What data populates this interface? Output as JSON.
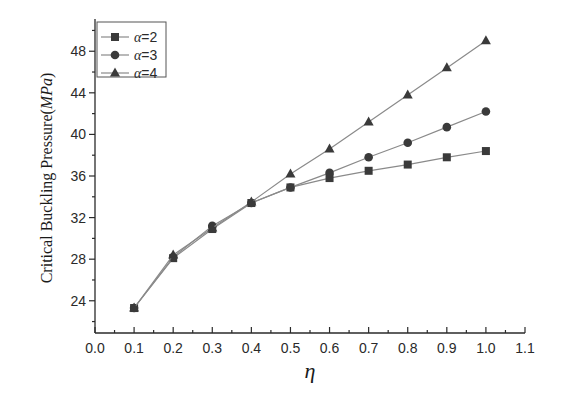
{
  "chart_data": {
    "type": "line",
    "title": "",
    "xlabel": "η",
    "ylabel": "Critical Buckling Pressure(MPa)",
    "ylabel_parts": {
      "main": "Critical Buckling Pressure(",
      "unit": "MPa",
      "close": ")"
    },
    "xlim": [
      0.0,
      1.1
    ],
    "ylim": [
      20.9,
      51.1
    ],
    "x_ticks": [
      0.0,
      0.1,
      0.2,
      0.3,
      0.4,
      0.5,
      0.6,
      0.7,
      0.8,
      0.9,
      1.0,
      1.1
    ],
    "x_tick_labels": [
      "0.0",
      "0.1",
      "0.2",
      "0.3",
      "0.4",
      "0.5",
      "0.6",
      "0.7",
      "0.8",
      "0.9",
      "1.0",
      "1.1"
    ],
    "y_ticks": [
      24,
      28,
      32,
      36,
      40,
      44,
      48
    ],
    "y_tick_labels": [
      "24",
      "28",
      "32",
      "36",
      "40",
      "44",
      "48"
    ],
    "y_minor_step": 2,
    "x_minor_step": 0.05,
    "grid": false,
    "legend_position": "upper left",
    "x": [
      0.1,
      0.2,
      0.3,
      0.4,
      0.5,
      0.6,
      0.7,
      0.8,
      0.9,
      1.0
    ],
    "series": [
      {
        "name": "α=2",
        "greek": "α",
        "suffix": "=2",
        "marker": "square",
        "values": [
          23.3,
          28.1,
          30.9,
          33.4,
          34.9,
          35.8,
          36.5,
          37.1,
          37.8,
          38.4
        ]
      },
      {
        "name": "α=3",
        "greek": "α",
        "suffix": "=3",
        "marker": "circle",
        "values": [
          23.3,
          28.2,
          31.2,
          33.4,
          34.9,
          36.3,
          37.8,
          39.2,
          40.7,
          42.2
        ]
      },
      {
        "name": "α=4",
        "greek": "α",
        "suffix": "=4",
        "marker": "triangle",
        "values": [
          23.3,
          28.4,
          31.0,
          33.5,
          36.2,
          38.6,
          41.2,
          43.8,
          46.4,
          49.0
        ]
      }
    ]
  },
  "style": {
    "line_color": "#8a8a8a",
    "marker_color": "#3a3a3a",
    "axis_color": "#2a2a2a"
  }
}
